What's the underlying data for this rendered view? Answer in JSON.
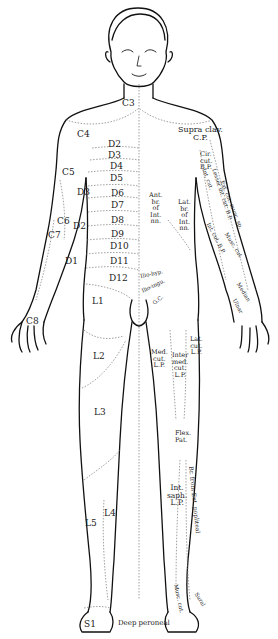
{
  "diagram": {
    "colors": {
      "outline": "#111111",
      "boundary": "#777777",
      "label": "#222222",
      "background": "#ffffff"
    },
    "segment_labels": [
      {
        "id": "c3",
        "text": "C3",
        "x": 122,
        "y": 99
      },
      {
        "id": "c4",
        "text": "C4",
        "x": 77,
        "y": 130
      },
      {
        "id": "c5",
        "text": "C5",
        "x": 62,
        "y": 168
      },
      {
        "id": "c6",
        "text": "C6",
        "x": 57,
        "y": 217
      },
      {
        "id": "c7",
        "text": "C7",
        "x": 48,
        "y": 231
      },
      {
        "id": "c8",
        "text": "C8",
        "x": 26,
        "y": 317
      },
      {
        "id": "d1-arm",
        "text": "D1",
        "x": 65,
        "y": 257
      },
      {
        "id": "d2-arm",
        "text": "D2",
        "x": 73,
        "y": 222
      },
      {
        "id": "d3-arm",
        "text": "D3",
        "x": 77,
        "y": 188
      },
      {
        "id": "d2",
        "text": "D2",
        "x": 108,
        "y": 140
      },
      {
        "id": "d3",
        "text": "D3",
        "x": 108,
        "y": 151
      },
      {
        "id": "d4",
        "text": "D4",
        "x": 110,
        "y": 162
      },
      {
        "id": "d5",
        "text": "D5",
        "x": 110,
        "y": 174
      },
      {
        "id": "d6",
        "text": "D6",
        "x": 111,
        "y": 189
      },
      {
        "id": "d7",
        "text": "D7",
        "x": 111,
        "y": 201
      },
      {
        "id": "d8",
        "text": "D8",
        "x": 111,
        "y": 216
      },
      {
        "id": "d9",
        "text": "D9",
        "x": 111,
        "y": 230
      },
      {
        "id": "d10",
        "text": "D10",
        "x": 110,
        "y": 242
      },
      {
        "id": "d11",
        "text": "D11",
        "x": 110,
        "y": 257
      },
      {
        "id": "d12",
        "text": "D12",
        "x": 109,
        "y": 274
      },
      {
        "id": "l1",
        "text": "L1",
        "x": 92,
        "y": 297
      },
      {
        "id": "l2",
        "text": "L2",
        "x": 93,
        "y": 352
      },
      {
        "id": "l3",
        "text": "L3",
        "x": 94,
        "y": 408
      },
      {
        "id": "l4",
        "text": "L4",
        "x": 104,
        "y": 509
      },
      {
        "id": "l5",
        "text": "L5",
        "x": 85,
        "y": 519
      },
      {
        "id": "s1",
        "text": "S1",
        "x": 84,
        "y": 620
      }
    ],
    "nerve_labels": [
      {
        "id": "supra-clav",
        "lines": [
          "Supra clav.",
          "C.P."
        ],
        "x": 178,
        "y": 126
      },
      {
        "id": "ant-br-int",
        "lines": [
          "Ant.",
          "br.",
          "of",
          "Int.",
          "nn."
        ],
        "x": 149,
        "y": 192
      },
      {
        "id": "lat-br-int",
        "lines": [
          "Lat.",
          "br.",
          "of",
          "Int.",
          "nn."
        ],
        "x": 178,
        "y": 199
      },
      {
        "id": "cir-cut",
        "lines": [
          "Cir.",
          "cut.",
          "B.P."
        ],
        "x": 200,
        "y": 151
      },
      {
        "id": "ilio-hyp",
        "lines": [
          "Ilio-hyp."
        ],
        "x": 140,
        "y": 274
      },
      {
        "id": "ilio-ing",
        "lines": [
          "Ilio-ingu."
        ],
        "x": 141,
        "y": 289
      },
      {
        "id": "genito-crural",
        "lines": [
          "G.C."
        ],
        "x": 152,
        "y": 302
      },
      {
        "id": "med-cut",
        "lines": [
          "Med.",
          "cut.",
          "L.P."
        ],
        "x": 151,
        "y": 349
      },
      {
        "id": "inter-med-cut",
        "lines": [
          "Inter",
          "med.",
          "cut.",
          "L.P."
        ],
        "x": 172,
        "y": 352
      },
      {
        "id": "ext-cut",
        "lines": [
          "Lat.",
          "cut.",
          "L.P."
        ],
        "x": 190,
        "y": 336
      },
      {
        "id": "flex-pat",
        "lines": [
          "Flex.",
          "Pat."
        ],
        "x": 175,
        "y": 430
      },
      {
        "id": "int-saph",
        "lines": [
          "Int.",
          "saph.",
          "L.P."
        ],
        "x": 167,
        "y": 484
      },
      {
        "id": "deep-peroneal",
        "lines": [
          "Deep peroneal"
        ],
        "x": 118,
        "y": 620
      }
    ],
    "rotated_labels": [
      {
        "id": "int-cut-arm",
        "text": "Int. cut.",
        "x": 206,
        "y": 168,
        "angle": 70
      },
      {
        "id": "lesser-int-cut",
        "text": "Lesser int. cut. B.P.",
        "x": 216,
        "y": 168,
        "angle": 72
      },
      {
        "id": "ext-cut-musc-sp",
        "text": "Ext. cut. musc. sp.",
        "x": 222,
        "y": 180,
        "angle": 68
      },
      {
        "id": "int-cut-bp",
        "text": "Int. cut. B.P.",
        "x": 210,
        "y": 220,
        "angle": 62
      },
      {
        "id": "musc-cut",
        "text": "Musc. cut.",
        "x": 226,
        "y": 232,
        "angle": 58
      },
      {
        "id": "br-ext-pop",
        "text": "Br. from Ext. popliteal",
        "x": 200,
        "y": 466,
        "angle": 84
      },
      {
        "id": "musc-cut-leg",
        "text": "Musc. cut.",
        "x": 184,
        "y": 585,
        "angle": 78
      },
      {
        "id": "sural",
        "text": "Sural",
        "x": 198,
        "y": 590,
        "angle": 58
      },
      {
        "id": "median",
        "text": "Median",
        "x": 240,
        "y": 282,
        "angle": 58
      },
      {
        "id": "ulnar",
        "text": "Ulnar",
        "x": 236,
        "y": 296,
        "angle": 62
      }
    ]
  }
}
